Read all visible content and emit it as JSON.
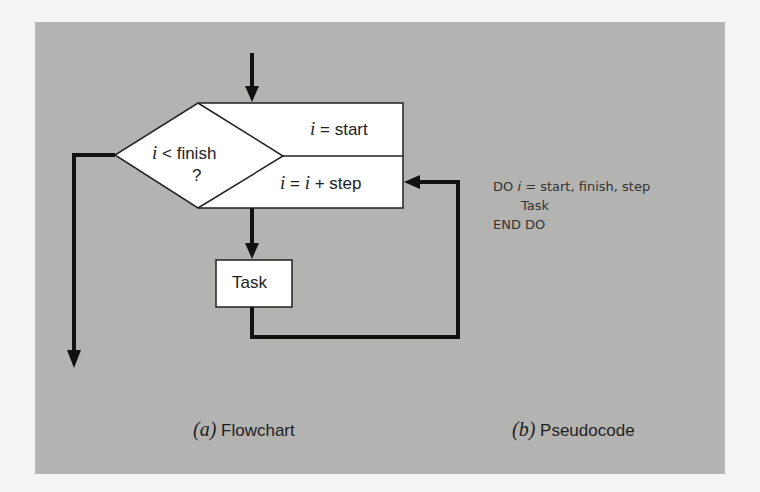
{
  "flowchart": {
    "condition_var": "i",
    "condition_text": "< finish",
    "condition_question": "?",
    "init_var": "i",
    "init_text": "= start",
    "step_var1": "i",
    "step_eq": "=",
    "step_var2": "i",
    "step_text": "+ step",
    "task_label": "Task"
  },
  "pseudocode": {
    "line1_prefix": "DO",
    "line1_var": "i",
    "line1_rest": "= start, finish, step",
    "line2": "Task",
    "line3": "END DO"
  },
  "captions": {
    "a_letter": "(a)",
    "a_text": "Flowchart",
    "b_letter": "(b)",
    "b_text": "Pseudocode"
  },
  "colors": {
    "panel": "#b3b3b1",
    "page": "#f4f4f2",
    "lines": "#111111",
    "box_fill": "#ffffff"
  }
}
